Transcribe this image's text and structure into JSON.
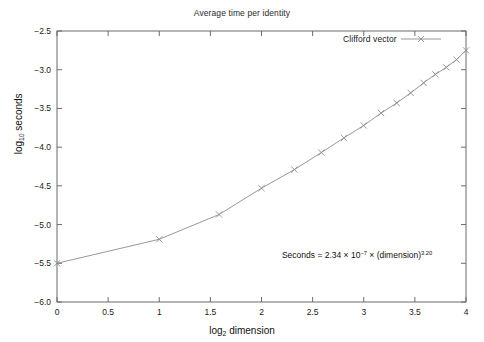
{
  "chart_data": {
    "type": "line",
    "title": "Average time per identity",
    "xlabel": "log₂ dimension",
    "ylabel": "log₁₀ seconds",
    "xlim": [
      0,
      4
    ],
    "ylim": [
      -6.0,
      -2.5
    ],
    "xticks": [
      "0",
      "0.5",
      "1",
      "1.5",
      "2",
      "2.5",
      "3",
      "3.5",
      "4"
    ],
    "xtick_values": [
      0,
      0.5,
      1,
      1.5,
      2,
      2.5,
      3,
      3.5,
      4
    ],
    "yticks": [
      "-2.5",
      "-3.0",
      "-3.5",
      "-4.0",
      "-4.5",
      "-5.0",
      "-5.5",
      "-6.0"
    ],
    "ytick_values": [
      -2.5,
      -3.0,
      -3.5,
      -4.0,
      -4.5,
      -5.0,
      -5.5,
      -6.0
    ],
    "grid": false,
    "legend_position": "top-right",
    "marker": "x",
    "series": [
      {
        "name": "Clifford vector",
        "color": "#8c8c8c",
        "x": [
          0,
          1,
          1.585,
          2,
          2.322,
          2.585,
          2.807,
          3,
          3.17,
          3.322,
          3.459,
          3.585,
          3.7,
          3.807,
          3.907,
          4
        ],
        "dimension": [
          1,
          2,
          3,
          4,
          5,
          6,
          7,
          8,
          9,
          10,
          11,
          12,
          13,
          14,
          15,
          16
        ],
        "y": [
          -5.5,
          -5.19,
          -4.87,
          -4.53,
          -4.29,
          -4.07,
          -3.88,
          -3.72,
          -3.56,
          -3.43,
          -3.3,
          -3.17,
          -3.06,
          -2.97,
          -2.87,
          -2.75
        ]
      }
    ],
    "annotations": [
      {
        "name": "fit-equation",
        "text": "Seconds = 2.34 × 10⁻⁷ × (dimension)^3.20",
        "coefficient": "2.34",
        "exponent_base10": "-7",
        "power": "3.20",
        "x": 2.2,
        "y": -5.42
      }
    ]
  },
  "legend": {
    "label": "Clifford vector"
  },
  "annotation_parts": {
    "lead": "Seconds = 2.34 × 10",
    "exp10": "−7",
    "mid": " × (dimension)",
    "power": "3.20"
  },
  "axis_title_parts": {
    "x_lead": "log",
    "x_sub": "2",
    "x_tail": " dimension",
    "y_lead": "log",
    "y_sub": "10",
    "y_tail": " seconds"
  },
  "colors": {
    "line": "#8c8c8c",
    "axis": "#6b6b6b",
    "text": "#1a1a1a",
    "background": "#ffffff"
  }
}
